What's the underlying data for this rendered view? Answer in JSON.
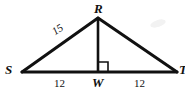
{
  "figure": {
    "kind": "geometry-diagram",
    "shape": "isosceles-triangle-with-altitude",
    "stroke_color": "#111111",
    "background_color": "#ffffff",
    "vertices": {
      "apex": "R",
      "left": "S",
      "right": "T",
      "foot": "W"
    },
    "labels": {
      "R": "R",
      "S": "S",
      "T": "T",
      "W": "W",
      "hypotenuse_left": "15",
      "base_left": "12",
      "base_right": "12"
    },
    "right_angle": {
      "at": "W",
      "marker": "right-angle-square"
    },
    "geometry": {
      "S": [
        22,
        72
      ],
      "T": [
        177,
        72
      ],
      "R": [
        98,
        18
      ],
      "W": [
        98,
        72
      ]
    }
  }
}
